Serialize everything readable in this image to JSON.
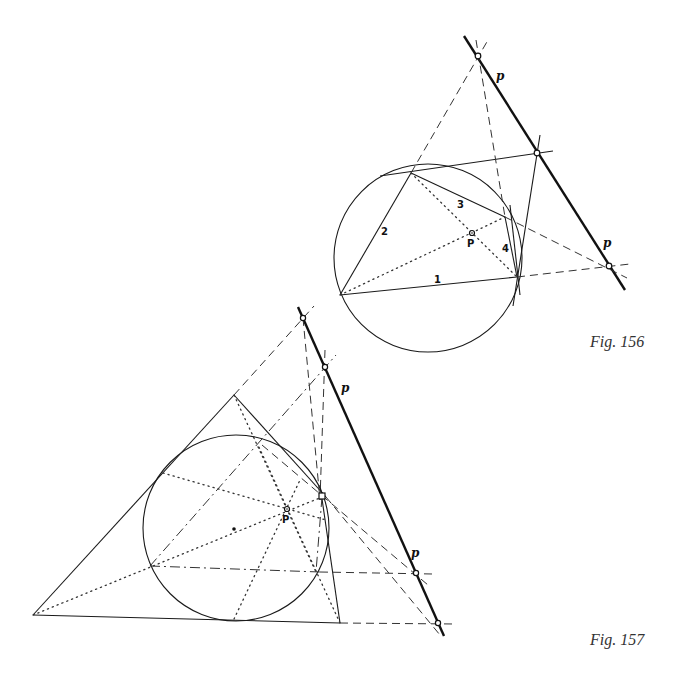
{
  "figures": [
    {
      "id": "fig156",
      "caption": "Fig. 156",
      "polar_line_label": "p",
      "pole_label": "P",
      "side_labels": [
        "1",
        "2",
        "3",
        "4"
      ],
      "description": "Circle with inscribed quadrilateral (sides 1-4), tangents, diagonals through pole P, and polar line p through intersection points"
    },
    {
      "id": "fig157",
      "caption": "Fig. 157",
      "polar_line_label": "p",
      "pole_label": "P",
      "description": "Triangle with incircle, dotted cevians through pole P, dash-dot chords, and polar line p through dashed-line intersection points"
    }
  ],
  "colors": {
    "ink": "#111111",
    "construction": "#333333",
    "background": "#ffffff"
  }
}
